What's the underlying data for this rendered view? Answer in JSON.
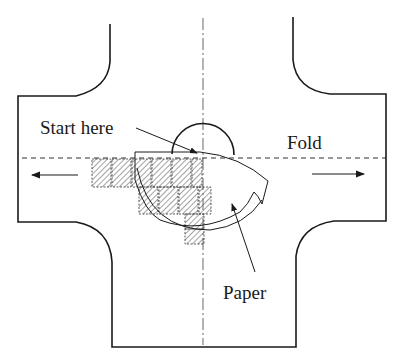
{
  "diagram": {
    "title": "",
    "labels": {
      "start": "Start here",
      "fold": "Fold",
      "paper": "Paper"
    },
    "colors": {
      "ink": "#1a1a1a",
      "hatch": "#555555",
      "background": "#ffffff"
    },
    "elements": [
      "cross-shaped-outline",
      "vertical-center-line",
      "horizontal-fold-line",
      "left-arrow",
      "right-arrow",
      "hatched-squares",
      "semicircle",
      "paper-sheet",
      "start-pointer",
      "paper-pointer"
    ]
  }
}
